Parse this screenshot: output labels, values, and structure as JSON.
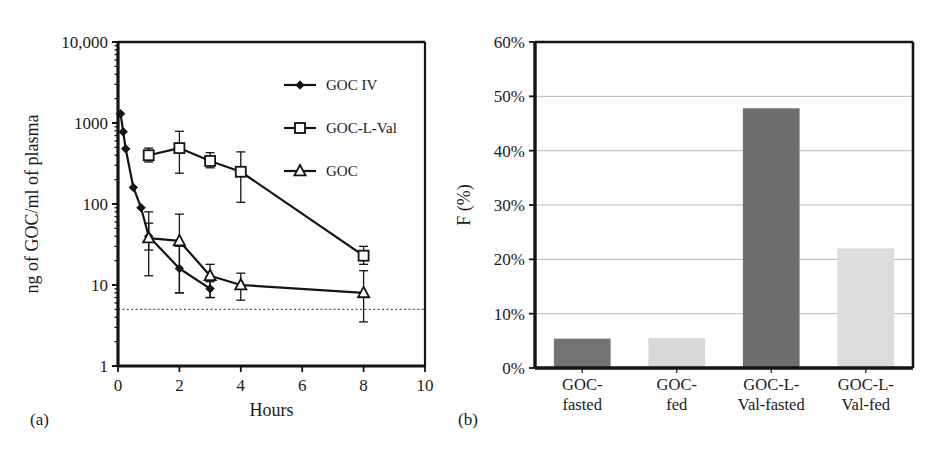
{
  "figure": {
    "panel_a_label": "(a)",
    "panel_b_label": "(b)"
  },
  "chart_data": [
    {
      "id": "panel-a",
      "type": "line",
      "title": "",
      "xlabel": "Hours",
      "ylabel": "ng of GOC/ml of plasma",
      "yscale": "log",
      "ylim": [
        1,
        10000
      ],
      "xlim": [
        0,
        10
      ],
      "xticks": [
        0,
        2,
        4,
        6,
        8,
        10
      ],
      "xtick_labels": [
        "0",
        "2",
        "4",
        "6",
        "8",
        "10"
      ],
      "yticks": [
        1,
        10,
        100,
        1000,
        10000
      ],
      "ytick_labels": [
        "1",
        "10",
        "100",
        "1000",
        "10,000"
      ],
      "grid": false,
      "legend_position": "top-right",
      "annotations": [
        {
          "name": "loq-line",
          "type": "hline",
          "y": 5,
          "style": "dotted"
        }
      ],
      "series": [
        {
          "name": "GOC IV",
          "marker": "filled-diamond",
          "x": [
            0.083,
            0.17,
            0.25,
            0.5,
            0.75,
            1,
            2,
            3
          ],
          "y": [
            1300,
            780,
            480,
            160,
            90,
            40,
            16,
            9
          ],
          "yerr_low": [
            1300,
            780,
            480,
            160,
            90,
            27,
            8,
            7
          ],
          "yerr_high": [
            1300,
            780,
            480,
            160,
            90,
            58,
            30,
            11
          ]
        },
        {
          "name": "GOC-L-Val",
          "marker": "open-square",
          "x": [
            1,
            2,
            3,
            4,
            8
          ],
          "y": [
            400,
            490,
            340,
            250,
            23
          ],
          "yerr_low": [
            330,
            240,
            280,
            105,
            18
          ],
          "yerr_high": [
            490,
            790,
            430,
            440,
            30
          ]
        },
        {
          "name": "GOC",
          "marker": "open-triangle",
          "x": [
            1,
            2,
            3,
            4,
            8
          ],
          "y": [
            38,
            35,
            13,
            10,
            8
          ],
          "yerr_low": [
            13,
            8,
            7,
            6.5,
            3.5
          ],
          "yerr_high": [
            80,
            75,
            18,
            14,
            15
          ]
        }
      ]
    },
    {
      "id": "panel-b",
      "type": "bar",
      "title": "",
      "xlabel": "",
      "ylabel": "F (%)",
      "ylim": [
        0,
        60
      ],
      "yticks": [
        0,
        10,
        20,
        30,
        40,
        50,
        60
      ],
      "ytick_labels": [
        "0%",
        "10%",
        "20%",
        "30%",
        "40%",
        "50%",
        "60%"
      ],
      "grid": true,
      "categories": [
        "GOC-fasted",
        "GOC-fed",
        "GOC-L-Val-fasted",
        "GOC-L-Val-fed"
      ],
      "category_lines": [
        [
          "GOC-",
          "fasted"
        ],
        [
          "GOC-",
          "fed"
        ],
        [
          "GOC-L-",
          "Val-fasted"
        ],
        [
          "GOC-L-",
          "Val-fed"
        ]
      ],
      "values": [
        5.4,
        5.5,
        47.8,
        22.0
      ],
      "bar_colors": [
        "#737373",
        "#d9d9d9",
        "#6e6e6e",
        "#dcdcdc"
      ]
    }
  ],
  "colors": {
    "axis": "#141414",
    "series_line": "#141414",
    "grid": "#b9b9b9",
    "loq": "#555555",
    "bar_dark": "#737373",
    "bar_light": "#d9d9d9",
    "background": "#ffffff"
  }
}
